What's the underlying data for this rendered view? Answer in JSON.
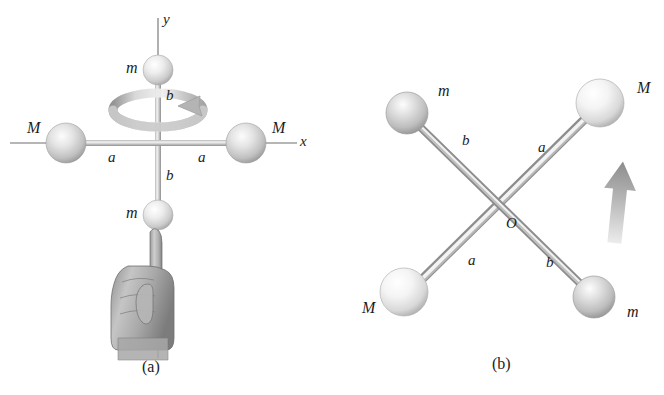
{
  "figure": {
    "background_color": "#ffffff",
    "width": 664,
    "height": 395
  },
  "panels": [
    {
      "id": "a",
      "caption": "(a)",
      "caption_pos": {
        "x": 142,
        "y": 358
      },
      "axes": [
        {
          "name": "y-axis",
          "label": "y",
          "label_pos": {
            "x": 163,
            "y": 12
          }
        },
        {
          "name": "x-axis",
          "label": "x",
          "label_pos": {
            "x": 300,
            "y": 134
          }
        }
      ],
      "spheres": [
        {
          "label": "m",
          "mass_class": "small",
          "cx": 158,
          "cy": 70,
          "r": 15,
          "shade": "light",
          "label_pos": {
            "x": 126,
            "y": 60
          }
        },
        {
          "label": "M",
          "mass_class": "large",
          "cx": 66,
          "cy": 143,
          "r": 20,
          "shade": "mid",
          "label_pos": {
            "x": 27,
            "y": 120
          }
        },
        {
          "label": "M",
          "mass_class": "large",
          "cx": 246,
          "cy": 143,
          "r": 20,
          "shade": "mid",
          "label_pos": {
            "x": 272,
            "y": 120
          }
        },
        {
          "label": "m",
          "mass_class": "small",
          "cx": 158,
          "cy": 215,
          "r": 15,
          "shade": "light",
          "label_pos": {
            "x": 126,
            "y": 205
          }
        }
      ],
      "rod_labels": [
        {
          "text": "b",
          "x": 166,
          "y": 88
        },
        {
          "text": "b",
          "x": 166,
          "y": 168
        },
        {
          "text": "a",
          "x": 108,
          "y": 150
        },
        {
          "text": "a",
          "x": 198,
          "y": 150
        }
      ],
      "rotation_arrow": {
        "name": "rotation-arrow",
        "description": "curved band encircling the y-axis with arrowhead",
        "direction": "counterclockwise-viewed-from-above"
      },
      "hand": {
        "name": "hand-illustration",
        "description": "fist with index finger pointing up supporting the lower m sphere"
      }
    },
    {
      "id": "b",
      "caption": "(b)",
      "caption_pos": {
        "x": 492,
        "y": 355
      },
      "origin_label": {
        "text": "O",
        "x": 506,
        "y": 216
      },
      "spheres": [
        {
          "label": "m",
          "mass_class": "small",
          "cx": 407,
          "cy": 113,
          "r": 21,
          "shade": "mid",
          "label_pos": {
            "x": 438,
            "y": 83
          }
        },
        {
          "label": "M",
          "mass_class": "large",
          "cx": 600,
          "cy": 103,
          "r": 24,
          "shade": "light",
          "label_pos": {
            "x": 637,
            "y": 80
          }
        },
        {
          "label": "M",
          "mass_class": "large",
          "cx": 404,
          "cy": 292,
          "r": 24,
          "shade": "light",
          "label_pos": {
            "x": 362,
            "y": 300
          }
        },
        {
          "label": "m",
          "mass_class": "small",
          "cx": 594,
          "cy": 297,
          "r": 21,
          "shade": "mid",
          "label_pos": {
            "x": 627,
            "y": 304
          }
        }
      ],
      "rod_labels": [
        {
          "text": "b",
          "x": 462,
          "y": 133
        },
        {
          "text": "a",
          "x": 538,
          "y": 140
        },
        {
          "text": "a",
          "x": 468,
          "y": 253
        },
        {
          "text": "b",
          "x": 546,
          "y": 255
        }
      ],
      "motion_arrow": {
        "name": "motion-arrow-up",
        "description": "upward pointing gray arrow indicating direction of motion"
      }
    }
  ],
  "colors": {
    "rod_light": "#f2f2f2",
    "rod_mid": "#c9c9c9",
    "rod_dark": "#9a9a9a",
    "sphere_light_hi": "#ffffff",
    "sphere_light_mid": "#e8e8e8",
    "sphere_light_lo": "#b4b4b4",
    "sphere_mid_hi": "#fbfbfb",
    "sphere_mid_mid": "#d6d6d6",
    "sphere_mid_lo": "#9e9e9e",
    "axis_line": "#6b6b6b",
    "text": "#1c1c1c",
    "arrow_gray": "#9b9b9b"
  }
}
